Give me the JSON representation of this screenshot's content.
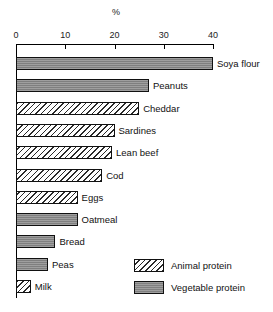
{
  "chart_data": {
    "type": "bar",
    "orientation": "horizontal",
    "title": "",
    "xlabel": "%",
    "ylabel": "",
    "xlim": [
      0,
      40
    ],
    "xticks": [
      0,
      10,
      20,
      30,
      40
    ],
    "xticklabels": [
      "0",
      "10",
      "20",
      "30",
      "40"
    ],
    "grid": false,
    "legend_position": "bottom-right",
    "categories": [
      "Soya flour",
      "Peanuts",
      "Cheddar",
      "Sardines",
      "Lean beef",
      "Cod",
      "Eggs",
      "Oatmeal",
      "Bread",
      "Peas",
      "Milk"
    ],
    "values": [
      40,
      27,
      25,
      20,
      19.5,
      17.5,
      12.5,
      12.5,
      8,
      6.5,
      3
    ],
    "groups": [
      "Vegetable protein",
      "Vegetable protein",
      "Animal protein",
      "Animal protein",
      "Animal protein",
      "Animal protein",
      "Animal protein",
      "Vegetable protein",
      "Vegetable protein",
      "Vegetable protein",
      "Animal protein"
    ],
    "series": [
      {
        "name": "Animal protein",
        "pattern": "diagonal-hatch",
        "color": "#f2f2f2",
        "points": [
          {
            "category": "Cheddar",
            "value": 25
          },
          {
            "category": "Sardines",
            "value": 20
          },
          {
            "category": "Lean beef",
            "value": 19.5
          },
          {
            "category": "Cod",
            "value": 17.5
          },
          {
            "category": "Eggs",
            "value": 12.5
          },
          {
            "category": "Milk",
            "value": 3
          }
        ]
      },
      {
        "name": "Vegetable protein",
        "pattern": "solid-gray",
        "color": "#8d8d8d",
        "points": [
          {
            "category": "Soya flour",
            "value": 40
          },
          {
            "category": "Peanuts",
            "value": 27
          },
          {
            "category": "Oatmeal",
            "value": 12.5
          },
          {
            "category": "Bread",
            "value": 8
          },
          {
            "category": "Peas",
            "value": 6.5
          }
        ]
      }
    ],
    "legend": [
      {
        "label": "Animal protein",
        "pattern": "diagonal-hatch"
      },
      {
        "label": "Vegetable protein",
        "pattern": "solid-gray"
      }
    ]
  },
  "axis": {
    "unit_label": "%",
    "tick_labels": [
      "0",
      "10",
      "20",
      "30",
      "40"
    ]
  },
  "bars": [
    {
      "label": "Soya flour",
      "value": 40,
      "group": "vegetable"
    },
    {
      "label": "Peanuts",
      "value": 27,
      "group": "vegetable"
    },
    {
      "label": "Cheddar",
      "value": 25,
      "group": "animal"
    },
    {
      "label": "Sardines",
      "value": 20,
      "group": "animal"
    },
    {
      "label": "Lean beef",
      "value": 19.5,
      "group": "animal"
    },
    {
      "label": "Cod",
      "value": 17.5,
      "group": "animal"
    },
    {
      "label": "Eggs",
      "value": 12.5,
      "group": "animal"
    },
    {
      "label": "Oatmeal",
      "value": 12.5,
      "group": "vegetable"
    },
    {
      "label": "Bread",
      "value": 8,
      "group": "vegetable"
    },
    {
      "label": "Peas",
      "value": 6.5,
      "group": "vegetable"
    },
    {
      "label": "Milk",
      "value": 3,
      "group": "animal"
    }
  ],
  "legend": {
    "items": [
      {
        "label": "Animal protein",
        "group": "animal"
      },
      {
        "label": "Vegetable protein",
        "group": "vegetable"
      }
    ]
  }
}
